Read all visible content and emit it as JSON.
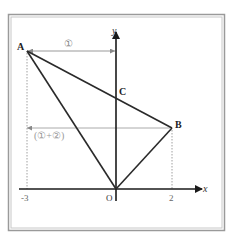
{
  "diagram": {
    "title": "",
    "frame": {
      "outer_color": "#9a9a9a",
      "inner_color": "#c8c8c8"
    },
    "axes": {
      "x_label": "x",
      "y_label": "y",
      "origin_label": "O",
      "tick_labels": {
        "neg3": "-3",
        "pos2": "2"
      }
    },
    "points": {
      "A": {
        "label": "A",
        "coords": [
          -3,
          null
        ]
      },
      "B": {
        "label": "B",
        "coords": [
          2,
          null
        ]
      },
      "C": {
        "label": "C",
        "coords": [
          0,
          null
        ]
      }
    },
    "segments": [
      {
        "from": "A",
        "to": "O"
      },
      {
        "from": "A",
        "to": "B"
      },
      {
        "from": "O",
        "to": "B"
      }
    ],
    "annotations": {
      "top_arrow_label": "①",
      "mid_arrow_label": "(①+②)"
    },
    "colors": {
      "line": "#2a2a2a",
      "guide": "#9a9a9a",
      "label_grey": "#888888",
      "text": "#222222"
    }
  }
}
